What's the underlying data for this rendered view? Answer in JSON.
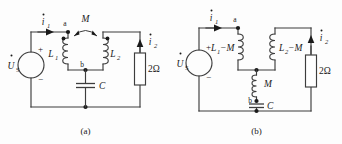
{
  "figure": {
    "background_color": "#fdfdfd",
    "line_color": "#3d3d3d",
    "text_color": "#1a1a1a"
  },
  "panels": [
    {
      "id": "a",
      "caption": "(a)",
      "source": {
        "symbol": "circle",
        "label": "U",
        "label_sub": "S",
        "label_accent": "dot",
        "plus": "+",
        "minus": "−"
      },
      "currents": [
        {
          "name": "i1",
          "label": "i",
          "sub": "1",
          "accent": "dot",
          "direction": "right"
        },
        {
          "name": "i2",
          "label": "i",
          "sub": "2",
          "accent": "dot",
          "direction": "up"
        }
      ],
      "nodes": [
        {
          "name": "node-a",
          "label": "a"
        },
        {
          "name": "node-b",
          "label": "b"
        }
      ],
      "components": [
        {
          "name": "inductor-L1",
          "type": "coil",
          "label": "L",
          "sub": "1",
          "dot_marked": true
        },
        {
          "name": "inductor-L2",
          "type": "coil",
          "label": "L",
          "sub": "2",
          "dot_marked": true
        },
        {
          "name": "mutual-coupling-M",
          "type": "mutual",
          "label": "M"
        },
        {
          "name": "capacitor-C",
          "type": "capacitor",
          "label": "C"
        },
        {
          "name": "resistor-2ohm",
          "type": "resistor",
          "label": "2Ω"
        }
      ]
    },
    {
      "id": "b",
      "caption": "(b)",
      "source": {
        "symbol": "circle",
        "label": "U",
        "label_sub": "S",
        "label_accent": "dot",
        "plus": "+",
        "minus": "−"
      },
      "currents": [
        {
          "name": "i1",
          "label": "i",
          "sub": "1",
          "accent": "dot",
          "direction": "right"
        },
        {
          "name": "i2",
          "label": "i",
          "sub": "2",
          "accent": "dot",
          "direction": "up"
        }
      ],
      "nodes": [
        {
          "name": "node-a",
          "label": "a"
        },
        {
          "name": "node-b",
          "label": "b"
        }
      ],
      "components": [
        {
          "name": "inductor-L1-minus-M",
          "type": "coil",
          "label": "L",
          "sub": "1",
          "suffix": "−M"
        },
        {
          "name": "inductor-L2-minus-M",
          "type": "coil",
          "label": "L",
          "sub": "2",
          "suffix": "−M"
        },
        {
          "name": "inductor-M",
          "type": "coil",
          "label": "M"
        },
        {
          "name": "capacitor-C",
          "type": "capacitor",
          "label": "C"
        },
        {
          "name": "resistor-2ohm",
          "type": "resistor",
          "label": "2Ω"
        }
      ]
    }
  ],
  "labels": {
    "a": {
      "i1_base": "i",
      "i1_sub": "1",
      "i2_base": "i",
      "i2_sub": "2",
      "us_base": "U",
      "us_sub": "S",
      "plus": "+",
      "minus": "−",
      "node_a": "a",
      "node_b": "b",
      "L1_base": "L",
      "L1_sub": "1",
      "L2_base": "L",
      "L2_sub": "2",
      "M": "M",
      "C": "C",
      "R": "2Ω",
      "caption": "(a)"
    },
    "b": {
      "i1_base": "i",
      "i1_sub": "1",
      "i2_base": "i",
      "i2_sub": "2",
      "us_base": "U",
      "us_sub": "S",
      "plus": "+",
      "minus": "−",
      "node_a": "a",
      "node_b": "b",
      "L1_base": "L",
      "L1_sub": "1",
      "L1_suffix": "−M",
      "L2_base": "L",
      "L2_sub": "2",
      "L2_suffix": "−M",
      "M": "M",
      "C": "C",
      "R": "2Ω",
      "caption": "(b)"
    }
  }
}
